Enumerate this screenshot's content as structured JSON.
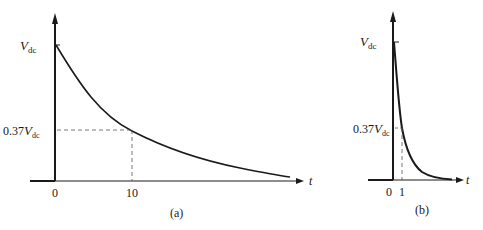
{
  "figure_a": {
    "caption": "(a)",
    "y_label_top": {
      "main": "V",
      "sub": "dc"
    },
    "y_label_mid": {
      "prefix": "0.37",
      "main": "V",
      "sub": "dc"
    },
    "x_ticks": [
      "0",
      "10"
    ],
    "x_axis_label": "t",
    "time_constant": 10
  },
  "figure_b": {
    "caption": "(b)",
    "y_label_top": {
      "main": "V",
      "sub": "dc"
    },
    "y_label_mid": {
      "prefix": "0.37",
      "main": "V",
      "sub": "dc"
    },
    "x_ticks": [
      "0",
      "1"
    ],
    "x_axis_label": "t",
    "time_constant": 1
  },
  "colors": {
    "ink": "#1a1a1a",
    "dashed": "#555555",
    "background": "#ffffff"
  }
}
